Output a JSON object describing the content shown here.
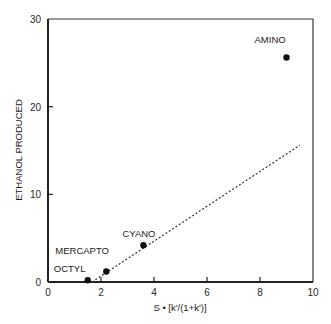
{
  "chart_data": {
    "type": "scatter",
    "title": "",
    "xlabel": "S • [k'/(1+k')]",
    "ylabel": "ETHANOL PRODUCED",
    "xlim": [
      0,
      10
    ],
    "ylim": [
      0,
      30
    ],
    "xticks": [
      0,
      2,
      4,
      6,
      8,
      10
    ],
    "yticks": [
      0,
      10,
      20,
      30
    ],
    "grid": false,
    "legend": null,
    "series": [
      {
        "name": "phases",
        "points": [
          {
            "label": "OCTYL",
            "x": 1.5,
            "y": 0.2
          },
          {
            "label": "MERCAPTO",
            "x": 2.2,
            "y": 1.2
          },
          {
            "label": "CYANO",
            "x": 3.6,
            "y": 4.2
          },
          {
            "label": "AMINO",
            "x": 9.0,
            "y": 25.6
          }
        ]
      }
    ],
    "fit_line": {
      "style": "dotted",
      "x": [
        1.66,
        9.5
      ],
      "y": [
        0,
        15.6
      ]
    }
  }
}
